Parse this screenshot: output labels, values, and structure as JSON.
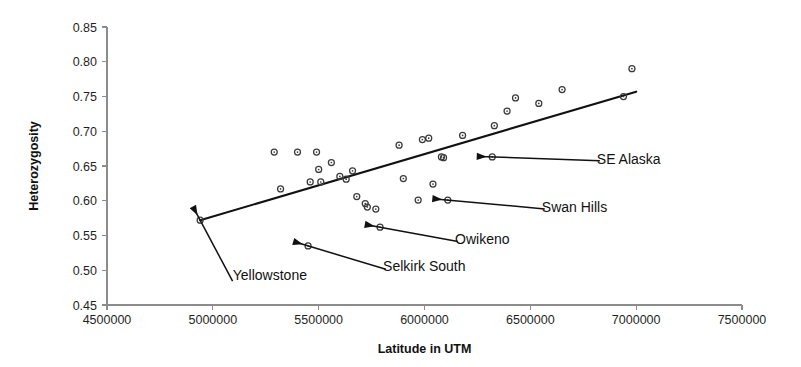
{
  "chart_data": {
    "type": "scatter",
    "title": "",
    "xlabel": "Latitude in UTM",
    "ylabel": "Heterozygosity",
    "xlim": [
      4500000,
      7500000
    ],
    "ylim": [
      0.45,
      0.85
    ],
    "grid": false,
    "legend": "none",
    "x_ticks": [
      "4500000",
      "5000000",
      "5500000",
      "6000000",
      "6500000",
      "7000000",
      "7500000"
    ],
    "x_tick_values": [
      4500000,
      5000000,
      5500000,
      6000000,
      6500000,
      7000000,
      7500000
    ],
    "y_ticks": [
      "0.45",
      "0.50",
      "0.55",
      "0.60",
      "0.65",
      "0.70",
      "0.75",
      "0.80",
      "0.85"
    ],
    "y_tick_values": [
      0.45,
      0.5,
      0.55,
      0.6,
      0.65,
      0.7,
      0.75,
      0.8,
      0.85
    ],
    "series": [
      {
        "name": "populations",
        "marker": "open-circle",
        "color": "#3a3a3a",
        "points": [
          {
            "x": 4940000,
            "y": 0.572,
            "label": "Yellowstone"
          },
          {
            "x": 5290000,
            "y": 0.67
          },
          {
            "x": 5320000,
            "y": 0.617
          },
          {
            "x": 5400000,
            "y": 0.67
          },
          {
            "x": 5450000,
            "y": 0.535,
            "label": "Selkirk South"
          },
          {
            "x": 5460000,
            "y": 0.627
          },
          {
            "x": 5490000,
            "y": 0.67
          },
          {
            "x": 5500000,
            "y": 0.645
          },
          {
            "x": 5510000,
            "y": 0.627
          },
          {
            "x": 5560000,
            "y": 0.655
          },
          {
            "x": 5600000,
            "y": 0.635
          },
          {
            "x": 5630000,
            "y": 0.631
          },
          {
            "x": 5660000,
            "y": 0.643
          },
          {
            "x": 5680000,
            "y": 0.606
          },
          {
            "x": 5720000,
            "y": 0.596
          },
          {
            "x": 5730000,
            "y": 0.591
          },
          {
            "x": 5770000,
            "y": 0.588
          },
          {
            "x": 5790000,
            "y": 0.562
          },
          {
            "x": 5880000,
            "y": 0.68
          },
          {
            "x": 5900000,
            "y": 0.632
          },
          {
            "x": 5970000,
            "y": 0.601
          },
          {
            "x": 5990000,
            "y": 0.688
          },
          {
            "x": 6020000,
            "y": 0.69
          },
          {
            "x": 6040000,
            "y": 0.624
          },
          {
            "x": 6080000,
            "y": 0.663
          },
          {
            "x": 6090000,
            "y": 0.662
          },
          {
            "x": 6110000,
            "y": 0.601,
            "label": "Swan Hills"
          },
          {
            "x": 6180000,
            "y": 0.694
          },
          {
            "x": 6320000,
            "y": 0.663,
            "label": "SE Alaska"
          },
          {
            "x": 6330000,
            "y": 0.708
          },
          {
            "x": 6390000,
            "y": 0.729
          },
          {
            "x": 6430000,
            "y": 0.748
          },
          {
            "x": 6540000,
            "y": 0.74
          },
          {
            "x": 6650000,
            "y": 0.76
          },
          {
            "x": 6940000,
            "y": 0.75
          },
          {
            "x": 6980000,
            "y": 0.79
          }
        ]
      }
    ],
    "trendline": {
      "name": "linear-fit",
      "color": "#111111",
      "x_start": 4940000,
      "y_start": 0.572,
      "x_end": 7000000,
      "y_end": 0.757
    },
    "annotations": [
      {
        "text": "SE Alaska",
        "point_x": 6320000,
        "point_y": 0.663,
        "label_x": 6800000,
        "label_y": 0.658
      },
      {
        "text": "Swan Hills",
        "point_x": 6110000,
        "point_y": 0.601,
        "label_x": 6540000,
        "label_y": 0.589
      },
      {
        "text": "Owikeno",
        "point_x": 5790000,
        "point_y": 0.562,
        "label_x": 6130000,
        "label_y": 0.543
      },
      {
        "text": "Selkirk South",
        "point_x": 5450000,
        "point_y": 0.535,
        "label_x": 5790000,
        "label_y": 0.504
      },
      {
        "text": "Yellowstone",
        "point_x": 4940000,
        "point_y": 0.572,
        "label_x": 5080000,
        "label_y": 0.492
      }
    ]
  }
}
